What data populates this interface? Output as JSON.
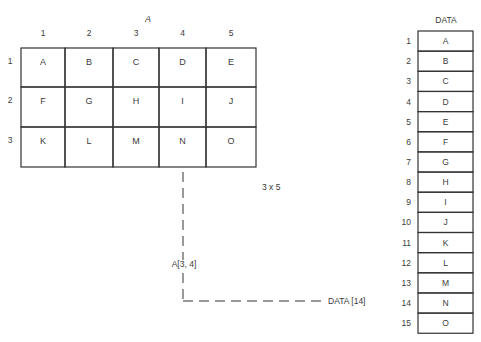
{
  "matrix": {
    "title": "A",
    "column_labels": [
      "1",
      "2",
      "3",
      "4",
      "5"
    ],
    "row_labels": [
      "1",
      "2",
      "3"
    ],
    "cells": [
      [
        "A",
        "B",
        "C",
        "D",
        "E"
      ],
      [
        "F",
        "G",
        "H",
        "I",
        "J"
      ],
      [
        "K",
        "L",
        "M",
        "N",
        "O"
      ]
    ],
    "dimension_label": "3 x 5"
  },
  "data_array": {
    "title": "DATA",
    "index_labels": [
      "1",
      "2",
      "3",
      "4",
      "5",
      "6",
      "7",
      "8",
      "9",
      "10",
      "11",
      "12",
      "13",
      "14",
      "15"
    ],
    "values": [
      "A",
      "B",
      "C",
      "D",
      "E",
      "F",
      "G",
      "H",
      "I",
      "J",
      "K",
      "L",
      "M",
      "N",
      "O"
    ]
  },
  "mapping": {
    "source_label": "A[3, 4]",
    "target_label": "DATA [14]",
    "source_row": 3,
    "source_col": 4,
    "target_index": 14
  }
}
